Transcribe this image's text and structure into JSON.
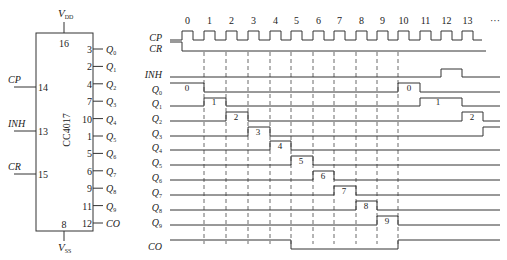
{
  "chip": {
    "name": "CC4017",
    "vdd": {
      "label": "V",
      "sub": "DD",
      "pin": "16"
    },
    "vss": {
      "label": "V",
      "sub": "SS",
      "pin": "8"
    },
    "inputs": [
      {
        "label": "CP",
        "pin": "14",
        "y": 87
      },
      {
        "label": "INH",
        "pin": "13",
        "y": 131
      },
      {
        "label": "CR",
        "pin": "15",
        "y": 174
      }
    ],
    "outputs": [
      {
        "pin": "3",
        "label": "Q",
        "sub": "0"
      },
      {
        "pin": "2",
        "label": "Q",
        "sub": "1"
      },
      {
        "pin": "4",
        "label": "Q",
        "sub": "2"
      },
      {
        "pin": "7",
        "label": "Q",
        "sub": "3"
      },
      {
        "pin": "10",
        "label": "Q",
        "sub": "4"
      },
      {
        "pin": "1",
        "label": "Q",
        "sub": "5"
      },
      {
        "pin": "5",
        "label": "Q",
        "sub": "6"
      },
      {
        "pin": "6",
        "label": "Q",
        "sub": "7"
      },
      {
        "pin": "9",
        "label": "Q",
        "sub": "8"
      },
      {
        "pin": "11",
        "label": "Q",
        "sub": "9"
      },
      {
        "pin": "12",
        "label": "CO",
        "sub": ""
      }
    ]
  },
  "timing": {
    "clock_numbers": [
      "0",
      "1",
      "2",
      "3",
      "4",
      "5",
      "6",
      "7",
      "8",
      "9",
      "10",
      "11",
      "12",
      "13"
    ],
    "ellipsis": "···",
    "clock_rise_x": [
      182,
      204,
      226,
      248,
      270,
      291,
      313,
      334,
      356,
      377,
      398,
      420,
      441,
      462
    ],
    "pulse_width": 11,
    "dashed_x": [
      204,
      226,
      248,
      270,
      291,
      313,
      334,
      356,
      377,
      398
    ],
    "signals": [
      {
        "name": "CP",
        "sub": "",
        "y_high": 31,
        "y_low": 40
      },
      {
        "name": "CR",
        "sub": "",
        "y_high": 42,
        "y_low": 51
      },
      {
        "name": "INH",
        "sub": "",
        "y_high": 69,
        "y_low": 77,
        "high": [
          [
            441,
            462
          ]
        ]
      },
      {
        "name": "Q",
        "sub": "0",
        "y_high": 83,
        "y_low": 92,
        "high": [
          [
            170,
            204
          ],
          [
            398,
            420
          ]
        ],
        "labels": [
          {
            "text": "0",
            "x": 187
          },
          {
            "text": "0",
            "x": 409
          }
        ]
      },
      {
        "name": "Q",
        "sub": "1",
        "y_high": 98,
        "y_low": 106,
        "high": [
          [
            204,
            226
          ],
          [
            420,
            462
          ]
        ],
        "labels": [
          {
            "text": "1",
            "x": 214
          },
          {
            "text": "1",
            "x": 438
          }
        ]
      },
      {
        "name": "Q",
        "sub": "2",
        "y_high": 112,
        "y_low": 121,
        "high": [
          [
            226,
            248
          ],
          [
            462,
            483
          ]
        ],
        "labels": [
          {
            "text": "2",
            "x": 236
          },
          {
            "text": "2",
            "x": 472
          }
        ]
      },
      {
        "name": "Q",
        "sub": "3",
        "y_high": 127,
        "y_low": 136,
        "high": [
          [
            248,
            270
          ],
          [
            483,
            500
          ]
        ],
        "labels": [
          {
            "text": "3",
            "x": 258
          }
        ]
      },
      {
        "name": "Q",
        "sub": "4",
        "y_high": 141,
        "y_low": 150,
        "high": [
          [
            270,
            291
          ]
        ],
        "labels": [
          {
            "text": "4",
            "x": 280
          }
        ]
      },
      {
        "name": "Q",
        "sub": "5",
        "y_high": 156,
        "y_low": 165,
        "high": [
          [
            291,
            313
          ]
        ],
        "labels": [
          {
            "text": "5",
            "x": 301
          }
        ]
      },
      {
        "name": "Q",
        "sub": "6",
        "y_high": 171,
        "y_low": 180,
        "high": [
          [
            313,
            334
          ]
        ],
        "labels": [
          {
            "text": "6",
            "x": 323
          }
        ]
      },
      {
        "name": "Q",
        "sub": "7",
        "y_high": 186,
        "y_low": 195,
        "high": [
          [
            334,
            356
          ]
        ],
        "labels": [
          {
            "text": "7",
            "x": 344
          }
        ]
      },
      {
        "name": "Q",
        "sub": "8",
        "y_high": 201,
        "y_low": 210,
        "high": [
          [
            356,
            377
          ]
        ],
        "labels": [
          {
            "text": "8",
            "x": 366
          }
        ]
      },
      {
        "name": "Q",
        "sub": "9",
        "y_high": 216,
        "y_low": 225,
        "high": [
          [
            377,
            398
          ]
        ],
        "labels": [
          {
            "text": "9",
            "x": 387
          }
        ]
      },
      {
        "name": "CO",
        "sub": "",
        "y_high": 240,
        "y_low": 249,
        "high": [
          [
            170,
            291
          ],
          [
            398,
            500
          ]
        ]
      }
    ]
  }
}
